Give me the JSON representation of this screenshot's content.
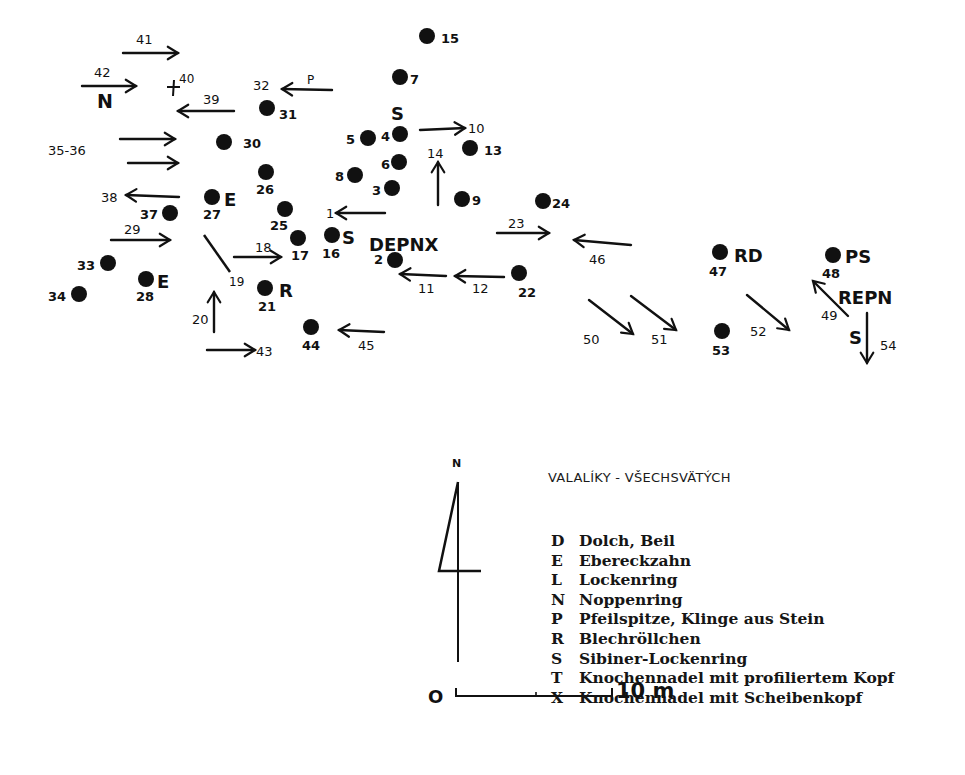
{
  "map": {
    "title": "VALALÍKY - VŠECHSVÄTÝCH",
    "ink_color": "#111111",
    "background": "#ffffff",
    "north_label": "N",
    "scale": {
      "start": "O",
      "end": "10 m"
    },
    "points": [
      {
        "id": "15",
        "x": 427,
        "y": 36,
        "label": "15",
        "lx": 441,
        "ly": 43
      },
      {
        "id": "7",
        "x": 400,
        "y": 77,
        "label": "7",
        "lx": 410,
        "ly": 84
      },
      {
        "id": "31",
        "x": 267,
        "y": 108,
        "label": "31",
        "lx": 279,
        "ly": 119
      },
      {
        "id": "30",
        "x": 224,
        "y": 142,
        "label": "30",
        "lx": 243,
        "ly": 148
      },
      {
        "id": "5",
        "x": 368,
        "y": 138,
        "label": "5",
        "lx": 346,
        "ly": 144
      },
      {
        "id": "4",
        "x": 400,
        "y": 134,
        "label": "4",
        "lx": 381,
        "ly": 141
      },
      {
        "id": "13",
        "x": 470,
        "y": 148,
        "label": "13",
        "lx": 484,
        "ly": 155
      },
      {
        "id": "6",
        "x": 399,
        "y": 162,
        "label": "6",
        "lx": 381,
        "ly": 169
      },
      {
        "id": "8",
        "x": 355,
        "y": 175,
        "label": "8",
        "lx": 335,
        "ly": 181
      },
      {
        "id": "3",
        "x": 392,
        "y": 188,
        "label": "3",
        "lx": 372,
        "ly": 195
      },
      {
        "id": "9",
        "x": 462,
        "y": 199,
        "label": "9",
        "lx": 472,
        "ly": 205
      },
      {
        "id": "24",
        "x": 543,
        "y": 201,
        "label": "24",
        "lx": 552,
        "ly": 208
      },
      {
        "id": "26",
        "x": 266,
        "y": 172,
        "label": "26",
        "lx": 256,
        "ly": 194
      },
      {
        "id": "27",
        "x": 212,
        "y": 197,
        "label": "27",
        "lx": 203,
        "ly": 219
      },
      {
        "id": "37",
        "x": 170,
        "y": 213,
        "label": "37",
        "lx": 140,
        "ly": 219
      },
      {
        "id": "25",
        "x": 285,
        "y": 209,
        "label": "25",
        "lx": 270,
        "ly": 230
      },
      {
        "id": "17",
        "x": 298,
        "y": 238,
        "label": "17",
        "lx": 291,
        "ly": 260
      },
      {
        "id": "16",
        "x": 332,
        "y": 235,
        "label": "16",
        "lx": 322,
        "ly": 258
      },
      {
        "id": "2",
        "x": 395,
        "y": 260,
        "label": "2",
        "lx": 374,
        "ly": 264
      },
      {
        "id": "22",
        "x": 519,
        "y": 273,
        "label": "22",
        "lx": 518,
        "ly": 297
      },
      {
        "id": "33",
        "x": 108,
        "y": 263,
        "label": "33",
        "lx": 77,
        "ly": 270
      },
      {
        "id": "28",
        "x": 146,
        "y": 279,
        "label": "28",
        "lx": 136,
        "ly": 301
      },
      {
        "id": "34",
        "x": 79,
        "y": 294,
        "label": "34",
        "lx": 48,
        "ly": 301
      },
      {
        "id": "21",
        "x": 265,
        "y": 288,
        "label": "21",
        "lx": 258,
        "ly": 311
      },
      {
        "id": "44",
        "x": 311,
        "y": 327,
        "label": "44",
        "lx": 302,
        "ly": 350
      },
      {
        "id": "47",
        "x": 720,
        "y": 252,
        "label": "47",
        "lx": 709,
        "ly": 276
      },
      {
        "id": "48",
        "x": 833,
        "y": 255,
        "label": "48",
        "lx": 822,
        "ly": 278
      },
      {
        "id": "53",
        "x": 722,
        "y": 331,
        "label": "53",
        "lx": 712,
        "ly": 355
      }
    ],
    "arrows": [
      {
        "id": "41",
        "x1": 123,
        "y1": 53,
        "x2": 178,
        "y2": 53,
        "label": "41",
        "lx": 136,
        "ly": 44
      },
      {
        "id": "42",
        "x1": 82,
        "y1": 86,
        "x2": 136,
        "y2": 86,
        "label": "42",
        "lx": 94,
        "ly": 77
      },
      {
        "id": "39",
        "x1": 234,
        "y1": 111,
        "x2": 178,
        "y2": 111,
        "label": "39",
        "lx": 203,
        "ly": 104
      },
      {
        "id": "32",
        "x1": 332,
        "y1": 90,
        "x2": 282,
        "y2": 89,
        "label": "32",
        "lx": 253,
        "ly": 90
      },
      {
        "id": "35",
        "x1": 120,
        "y1": 139,
        "x2": 175,
        "y2": 139,
        "label": "",
        "lx": 0,
        "ly": 0
      },
      {
        "id": "36",
        "x1": 128,
        "y1": 163,
        "x2": 178,
        "y2": 163,
        "label": "",
        "lx": 0,
        "ly": 0
      },
      {
        "id": "38",
        "x1": 179,
        "y1": 197,
        "x2": 126,
        "y2": 195,
        "label": "38",
        "lx": 101,
        "ly": 202
      },
      {
        "id": "10",
        "x1": 420,
        "y1": 130,
        "x2": 465,
        "y2": 128,
        "label": "10",
        "lx": 468,
        "ly": 133
      },
      {
        "id": "14",
        "x1": 438,
        "y1": 205,
        "x2": 438,
        "y2": 162,
        "label": "14",
        "lx": 427,
        "ly": 158
      },
      {
        "id": "1",
        "x1": 385,
        "y1": 213,
        "x2": 336,
        "y2": 213,
        "label": "1",
        "lx": 326,
        "ly": 218
      },
      {
        "id": "29",
        "x1": 111,
        "y1": 240,
        "x2": 170,
        "y2": 240,
        "label": "29",
        "lx": 124,
        "ly": 234
      },
      {
        "id": "18",
        "x1": 234,
        "y1": 257,
        "x2": 281,
        "y2": 257,
        "label": "18",
        "lx": 255,
        "ly": 252
      },
      {
        "id": "20",
        "x1": 214,
        "y1": 332,
        "x2": 214,
        "y2": 292,
        "label": "20",
        "lx": 192,
        "ly": 324
      },
      {
        "id": "43",
        "x1": 207,
        "y1": 350,
        "x2": 255,
        "y2": 350,
        "label": "43",
        "lx": 256,
        "ly": 356
      },
      {
        "id": "45",
        "x1": 384,
        "y1": 332,
        "x2": 339,
        "y2": 330,
        "label": "45",
        "lx": 358,
        "ly": 350
      },
      {
        "id": "11",
        "x1": 446,
        "y1": 276,
        "x2": 400,
        "y2": 274,
        "label": "11",
        "lx": 418,
        "ly": 293
      },
      {
        "id": "12",
        "x1": 504,
        "y1": 277,
        "x2": 455,
        "y2": 276,
        "label": "12",
        "lx": 472,
        "ly": 293
      },
      {
        "id": "23",
        "x1": 497,
        "y1": 233,
        "x2": 549,
        "y2": 233,
        "label": "23",
        "lx": 508,
        "ly": 228
      },
      {
        "id": "46",
        "x1": 631,
        "y1": 245,
        "x2": 574,
        "y2": 240,
        "label": "46",
        "lx": 589,
        "ly": 264
      },
      {
        "id": "50",
        "x1": 589,
        "y1": 300,
        "x2": 633,
        "y2": 334,
        "label": "50",
        "lx": 583,
        "ly": 344
      },
      {
        "id": "51",
        "x1": 631,
        "y1": 296,
        "x2": 676,
        "y2": 330,
        "label": "51",
        "lx": 651,
        "ly": 344
      },
      {
        "id": "52",
        "x1": 747,
        "y1": 295,
        "x2": 789,
        "y2": 330,
        "label": "52",
        "lx": 750,
        "ly": 336
      },
      {
        "id": "49",
        "x1": 848,
        "y1": 316,
        "x2": 813,
        "y2": 281,
        "label": "49",
        "lx": 821,
        "ly": 320
      },
      {
        "id": "54",
        "x1": 867,
        "y1": 313,
        "x2": 867,
        "y2": 363,
        "label": "54",
        "lx": 880,
        "ly": 350
      }
    ],
    "free_labels": [
      {
        "id": "35-36",
        "text": "35-36",
        "x": 48,
        "y": 155,
        "size": 13,
        "bold": false
      },
      {
        "id": "p",
        "text": "P",
        "x": 307,
        "y": 84,
        "size": 12,
        "bold": false
      },
      {
        "id": "40",
        "text": "40",
        "x": 179,
        "y": 83,
        "size": 12,
        "bold": false
      },
      {
        "id": "19",
        "text": "19",
        "x": 229,
        "y": 286,
        "size": 12,
        "bold": false
      }
    ],
    "category_marks": [
      {
        "id": "N-42",
        "text": "N",
        "x": 97,
        "y": 108,
        "size": 19
      },
      {
        "id": "S-4",
        "text": "S",
        "x": 391,
        "y": 120,
        "size": 18
      },
      {
        "id": "E-27",
        "text": "E",
        "x": 224,
        "y": 206,
        "size": 18
      },
      {
        "id": "E-28",
        "text": "E",
        "x": 157,
        "y": 288,
        "size": 18
      },
      {
        "id": "S-16",
        "text": "S",
        "x": 342,
        "y": 244,
        "size": 18
      },
      {
        "id": "DEPNX",
        "text": "DEPNX",
        "x": 369,
        "y": 251,
        "size": 18
      },
      {
        "id": "R-21",
        "text": "R",
        "x": 279,
        "y": 297,
        "size": 18
      },
      {
        "id": "RD-47",
        "text": "RD",
        "x": 734,
        "y": 262,
        "size": 18
      },
      {
        "id": "PS-48",
        "text": "PS",
        "x": 845,
        "y": 263,
        "size": 18
      },
      {
        "id": "REPN",
        "text": "REPN",
        "x": 838,
        "y": 304,
        "size": 18
      },
      {
        "id": "S-54",
        "text": "S",
        "x": 849,
        "y": 344,
        "size": 18
      }
    ]
  },
  "legend": {
    "title": "VALALÍKY - VŠECHSVÄTÝCH",
    "items": [
      {
        "key": "D",
        "text": "Dolch, Beil"
      },
      {
        "key": "E",
        "text": "Ebereckzahn"
      },
      {
        "key": "L",
        "text": "Lockenring"
      },
      {
        "key": "N",
        "text": "Noppenring"
      },
      {
        "key": "P",
        "text": "Pfeilspitze, Klinge aus Stein"
      },
      {
        "key": "R",
        "text": "Blechröllchen"
      },
      {
        "key": "S",
        "text": "Sibiner-Lockenring"
      },
      {
        "key": "T",
        "text": "Knochennadel mit profiliertem Kopf"
      },
      {
        "key": "X",
        "text": "Knochennadel mit Scheibenkopf"
      }
    ]
  }
}
